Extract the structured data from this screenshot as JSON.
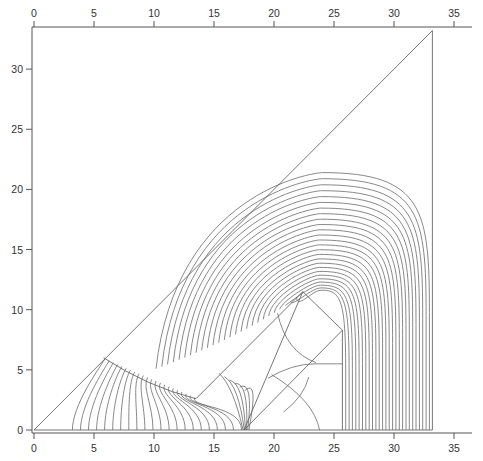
{
  "chart_data": {
    "type": "line",
    "title": "",
    "xlabel": "",
    "ylabel": "",
    "xlim": [
      0,
      36.5
    ],
    "ylim": [
      0,
      33.5
    ],
    "grid": false,
    "legend": null,
    "x_ticks": [
      0,
      5,
      10,
      15,
      20,
      25,
      30,
      35
    ],
    "x_tick_labels": [
      "0",
      "5",
      "10",
      "15",
      "20",
      "25",
      "30",
      "35"
    ],
    "y_ticks": [
      0,
      5,
      10,
      15,
      20,
      25,
      30
    ],
    "y_tick_labels": [
      "0",
      "5",
      "10",
      "15",
      "20",
      "25",
      "30"
    ],
    "top_axis_ticks": [
      0,
      5,
      10,
      15,
      20,
      25,
      30,
      35
    ],
    "boundaries": {
      "outer_triangle": [
        [
          0,
          0
        ],
        [
          33.2,
          33.2
        ],
        [
          33.2,
          0
        ],
        [
          0,
          0
        ]
      ],
      "inner_quadrilateral": [
        [
          17.5,
          0
        ],
        [
          22.4,
          11.5
        ],
        [
          25.7,
          8.3
        ],
        [
          25.7,
          0
        ]
      ],
      "dividing_curve": [
        [
          5.8,
          6.0
        ],
        [
          9.5,
          4.2
        ],
        [
          13.5,
          2.6
        ],
        [
          22.4,
          11.5
        ]
      ],
      "inner_diagonal": [
        [
          17.5,
          0
        ],
        [
          25.7,
          8.3
        ]
      ]
    },
    "field_lines": {
      "description": "Nested contour lines radiating around an apex at (22.4, 11.5); those in the upper band arch over to become vertical lines between x=25.7 and x=33.2",
      "apex": [
        22.4,
        11.5
      ],
      "count_upper": 26,
      "outermost_peak": [
        29.5,
        21.4
      ],
      "vertical_band_x": [
        25.7,
        33.2
      ],
      "count_lower_left": 22,
      "lower_left_start_x": 3.2
    },
    "line_color": "#6a6a6a",
    "axis_color": "#555555"
  }
}
